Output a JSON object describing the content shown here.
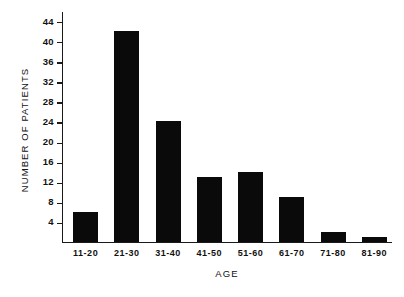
{
  "chart_data": {
    "type": "bar",
    "title": "",
    "xlabel": "AGE",
    "ylabel": "NUMBER OF PATIENTS",
    "categories": [
      "11-20",
      "21-30",
      "31-40",
      "41-50",
      "51-60",
      "61-70",
      "71-80",
      "81-90"
    ],
    "values": [
      6,
      42,
      24,
      13,
      14,
      9,
      2,
      1
    ],
    "ylim": [
      0,
      46
    ],
    "yticks": [
      4,
      8,
      12,
      16,
      20,
      24,
      28,
      32,
      36,
      40,
      44
    ],
    "ytick_labels": [
      "4",
      "8",
      "12",
      "16",
      "20",
      "24",
      "28",
      "32",
      "36",
      "40",
      "44"
    ],
    "grid": false,
    "legend": false,
    "bar_color": "#0a0a0a",
    "axis_color": "#1a1a1a"
  }
}
